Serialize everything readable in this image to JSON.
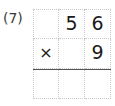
{
  "problem": {
    "number_label": "(7)",
    "operation": "multiplication",
    "multiplicand": "56",
    "multiplier": "9",
    "answer": ""
  },
  "grid": {
    "rows": 3,
    "columns": 3,
    "line_color": "#c9c9c9",
    "rule_color": "#555555",
    "cells": [
      [
        {
          "name": "cell-r0-c0",
          "value": ""
        },
        {
          "name": "cell-r0-c1",
          "value": "5"
        },
        {
          "name": "cell-r0-c2",
          "value": "6"
        }
      ],
      [
        {
          "name": "cell-r1-c0",
          "value": "×"
        },
        {
          "name": "cell-r1-c1",
          "value": ""
        },
        {
          "name": "cell-r1-c2",
          "value": "9"
        }
      ],
      [
        {
          "name": "cell-r2-c0",
          "value": ""
        },
        {
          "name": "cell-r2-c1",
          "value": ""
        },
        {
          "name": "cell-r2-c2",
          "value": ""
        }
      ]
    ]
  }
}
